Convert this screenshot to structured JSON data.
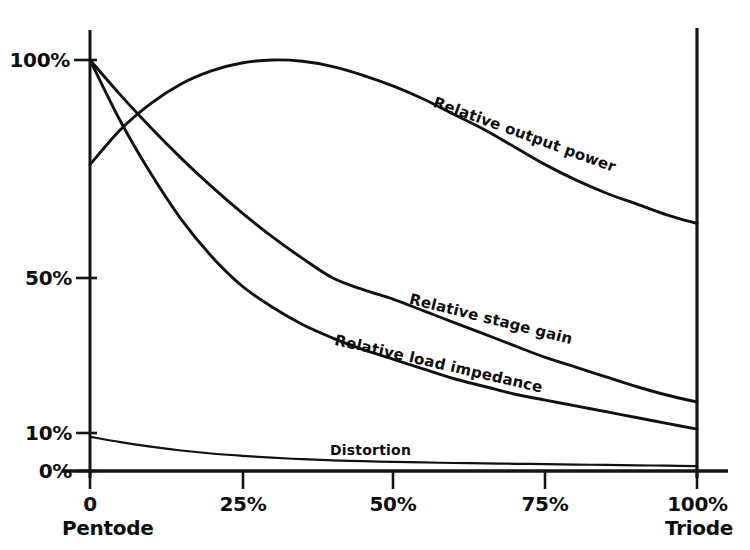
{
  "chart_data": {
    "type": "line",
    "title": "",
    "subtitle": "",
    "xlabel": "",
    "ylabel": "",
    "xlim": [
      0,
      100
    ],
    "ylim": [
      0,
      100
    ],
    "grid": false,
    "legend_position": "inline-curve-labels",
    "x_tick_labels": [
      "0",
      "25%",
      "50%",
      "75%",
      "100%"
    ],
    "x_tick_values": [
      0,
      25,
      50,
      75,
      100
    ],
    "y_tick_labels": [
      "100%",
      "50%",
      "10%",
      "0%"
    ],
    "y_tick_values": [
      100,
      50,
      10,
      0
    ],
    "x_axis_end_labels": {
      "left": "Pentode",
      "right": "Triode"
    },
    "x": [
      0,
      5,
      10,
      15,
      20,
      25,
      30,
      35,
      40,
      45,
      50,
      55,
      60,
      65,
      70,
      75,
      80,
      85,
      90,
      95,
      100
    ],
    "series": [
      {
        "name": "Relative output power",
        "label": "Relative output power",
        "values": [
          76,
          84,
          90,
          94.5,
          97.5,
          99.3,
          100,
          99.7,
          98.5,
          96.5,
          94,
          91,
          87.5,
          84,
          80,
          76,
          72.5,
          69.5,
          67,
          64.5,
          62.5
        ]
      },
      {
        "name": "Relative stage gain",
        "label": "Relative stage gain",
        "values": [
          100,
          92,
          84.5,
          77.5,
          71,
          65,
          59.5,
          54.5,
          50,
          47,
          44.5,
          41.5,
          38.5,
          35.5,
          32.5,
          29.5,
          27,
          24.5,
          22,
          19.8,
          18
        ]
      },
      {
        "name": "Relative load impedance",
        "label": "Relative load impedance",
        "values": [
          100,
          86,
          74,
          63.5,
          55,
          48,
          42.5,
          38,
          34.5,
          31.5,
          29,
          26.5,
          24,
          22,
          20,
          18.5,
          17,
          15.5,
          14,
          12.5,
          11
        ]
      },
      {
        "name": "Distortion",
        "label": "Distortion",
        "values": [
          9,
          7.6,
          6.4,
          5.4,
          4.6,
          4,
          3.5,
          3.1,
          2.8,
          2.6,
          2.4,
          2.25,
          2.1,
          2,
          1.9,
          1.8,
          1.7,
          1.6,
          1.5,
          1.4,
          1.3
        ]
      }
    ],
    "axis_color": "#141414",
    "curve_color": "#111111",
    "background_color": "#ffffff"
  }
}
